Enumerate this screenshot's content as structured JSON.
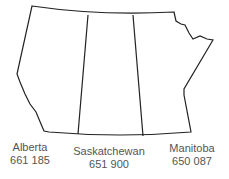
{
  "map": {
    "provinces": [
      {
        "name": "Alberta",
        "value": "661 185"
      },
      {
        "name": "Saskatchewan",
        "value": "651 900"
      },
      {
        "name": "Manitoba",
        "value": "650 087"
      }
    ],
    "colors": {
      "outline": "#222222",
      "text": "#555555"
    }
  }
}
